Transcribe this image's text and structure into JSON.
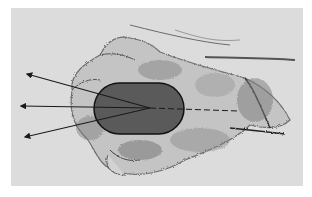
{
  "figure": {
    "colors": {
      "background": "#dcdcdc",
      "page": "#ffffff",
      "mouse_fill": "#5a5a5a",
      "mouse_outline": "#111111",
      "arrow": "#1a1a1a",
      "sketch_shading": "#8a8a8a"
    },
    "mouse": {
      "cx": 139,
      "cy": 108,
      "width": 90,
      "height": 51
    },
    "pivot": {
      "x": 150,
      "y": 108
    },
    "arrows": [
      {
        "name": "upper-left",
        "tip": [
          26,
          74
        ]
      },
      {
        "name": "left",
        "tip": [
          20,
          106
        ]
      },
      {
        "name": "lower-left",
        "tip": [
          24,
          137
        ]
      }
    ],
    "dashed_line": {
      "from": [
        150,
        108
      ],
      "to": [
        238,
        111
      ]
    }
  }
}
